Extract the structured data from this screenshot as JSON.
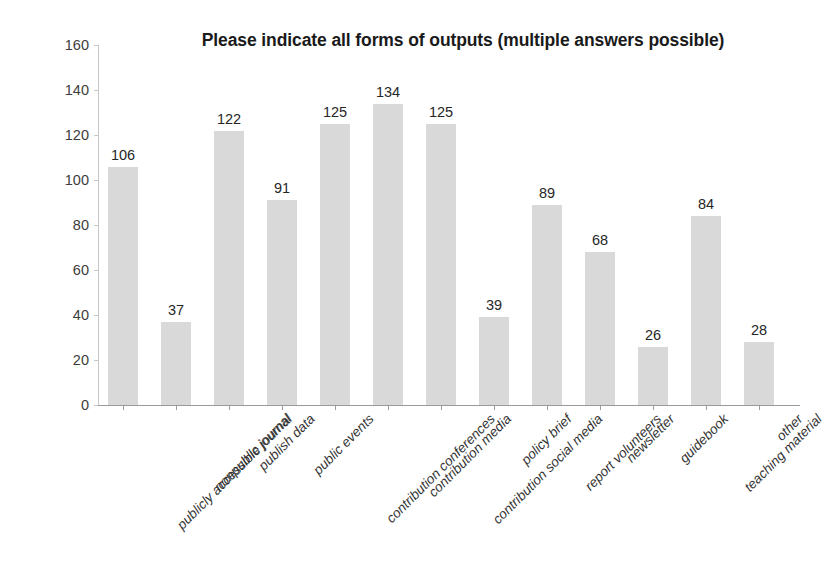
{
  "chart_data": {
    "type": "bar",
    "title": "Please indicate all forms of outputs (multiple answers possible)",
    "xlabel": "",
    "ylabel": "",
    "ylim": [
      0,
      160
    ],
    "yticks": [
      0,
      20,
      40,
      60,
      80,
      100,
      120,
      140,
      160
    ],
    "grid": false,
    "legend": false,
    "bar_color": "#d9d9d9",
    "categories": [
      "publicly accessible journal",
      "nonpublic journal",
      "publish data",
      "public events",
      "contribution conferences",
      "contribution media",
      "contribution social media",
      "policy brief",
      "report volunteers",
      "newsletter",
      "guidebook",
      "teaching material",
      "other"
    ],
    "values": [
      106,
      37,
      122,
      91,
      125,
      134,
      125,
      39,
      89,
      68,
      26,
      84,
      28
    ],
    "value_labels": [
      "106",
      "37",
      "122",
      "91",
      "125",
      "134",
      "125",
      "39",
      "89",
      "68",
      "26",
      "84",
      "28"
    ],
    "ytick_labels": [
      "0",
      "20",
      "40",
      "60",
      "80",
      "100",
      "120",
      "140",
      "160"
    ]
  }
}
